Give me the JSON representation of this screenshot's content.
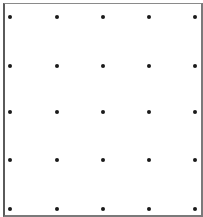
{
  "figure": {
    "rows": 5,
    "cols": 5,
    "dot_color": "#1a1a1a",
    "border_color": "#6a6a6a",
    "dot_x_positions": [
      10,
      57,
      103,
      149,
      195
    ],
    "dot_y_positions": [
      17,
      66,
      112,
      160,
      209
    ]
  }
}
